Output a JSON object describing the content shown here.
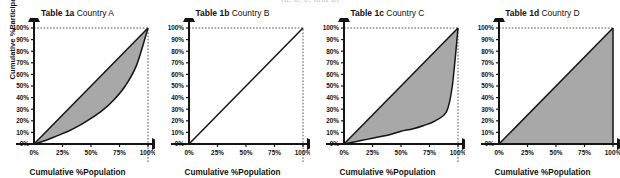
{
  "clipped_header": "(a, b, c, and d)",
  "axes": {
    "xlabel": "Cumulative %Population",
    "ylabel": "Cumulative %Participation",
    "x_ticks": [
      "0%",
      "25%",
      "50%",
      "75%",
      "100%"
    ],
    "x_tick_values": [
      0,
      25,
      50,
      75,
      100
    ],
    "y_ticks": [
      "0%",
      "10%",
      "20%",
      "30%",
      "40%",
      "50%",
      "60%",
      "70%",
      "80%",
      "90%",
      "100%"
    ],
    "y_tick_values": [
      0,
      10,
      20,
      30,
      40,
      50,
      60,
      70,
      80,
      90,
      100
    ],
    "xlim": [
      0,
      100
    ],
    "ylim": [
      0,
      100
    ]
  },
  "colors": {
    "fill": "#a8a8a8",
    "curve": "#141414",
    "axis": "#141414",
    "guide": "#555555",
    "background": "#ffffff"
  },
  "chart_data": [
    {
      "type": "area",
      "title": "Table 1a Country A",
      "title_bold": "Table 1a",
      "title_regular": "Country A",
      "xlabel": "Cumulative %Population",
      "ylabel": "Cumulative %Participation",
      "xlim": [
        0,
        100
      ],
      "ylim": [
        0,
        100
      ],
      "grid": false,
      "legend": "none",
      "annotations": [
        "dotted guide line at x=100%",
        "dotted guide line at y=100%"
      ],
      "series": [
        {
          "name": "Line of equality",
          "style": "solid",
          "x": [
            0,
            100
          ],
          "values": [
            0,
            100
          ]
        },
        {
          "name": "Lorenz curve",
          "style": "solid",
          "x": [
            0,
            10,
            20,
            30,
            40,
            50,
            60,
            70,
            80,
            90,
            100
          ],
          "values": [
            0,
            3,
            7,
            11,
            16,
            22,
            29,
            38,
            50,
            68,
            100
          ]
        }
      ],
      "shaded_between": [
        "Line of equality",
        "Lorenz curve"
      ]
    },
    {
      "type": "line",
      "title": "Table 1b Country B",
      "title_bold": "Table 1b",
      "title_regular": "Country B",
      "xlabel": "Cumulative %Population",
      "ylabel": "Cumulative %Participation",
      "xlim": [
        0,
        100
      ],
      "ylim": [
        0,
        100
      ],
      "grid": false,
      "legend": "none",
      "annotations": [
        "dotted guide line at x=100%",
        "dotted guide line at y=100%"
      ],
      "series": [
        {
          "name": "Line of equality",
          "style": "solid",
          "x": [
            0,
            100
          ],
          "values": [
            0,
            100
          ]
        }
      ],
      "shaded_between": []
    },
    {
      "type": "area",
      "title": "Table 1c Country C",
      "title_bold": "Table 1c",
      "title_regular": "Country C",
      "xlabel": "Cumulative %Population",
      "ylabel": "Cumulative %Participation",
      "xlim": [
        0,
        100
      ],
      "ylim": [
        0,
        100
      ],
      "grid": false,
      "legend": "none",
      "annotations": [
        "dotted guide line at x=100%",
        "dotted guide line at y=100%"
      ],
      "series": [
        {
          "name": "Line of equality",
          "style": "solid",
          "x": [
            0,
            100
          ],
          "values": [
            0,
            100
          ]
        },
        {
          "name": "Lorenz curve",
          "style": "solid",
          "x": [
            0,
            10,
            20,
            30,
            40,
            50,
            60,
            70,
            80,
            90,
            95,
            100
          ],
          "values": [
            0,
            2,
            4,
            6,
            8,
            11,
            13,
            16,
            20,
            28,
            50,
            100
          ]
        }
      ],
      "shaded_between": [
        "Line of equality",
        "Lorenz curve"
      ]
    },
    {
      "type": "area",
      "title": "Table 1d Country D",
      "title_bold": "Table 1d",
      "title_regular": "Country D",
      "xlabel": "Cumulative %Population",
      "ylabel": "Cumulative %Participation",
      "xlim": [
        0,
        100
      ],
      "ylim": [
        0,
        100
      ],
      "grid": false,
      "legend": "none",
      "annotations": [
        "dotted guide line at y=100%"
      ],
      "series": [
        {
          "name": "Line of equality",
          "style": "solid",
          "x": [
            0,
            100
          ],
          "values": [
            0,
            100
          ]
        },
        {
          "name": "Lorenz curve",
          "style": "solid",
          "x": [
            0,
            100,
            100
          ],
          "values": [
            0,
            0,
            100
          ]
        }
      ],
      "shaded_between": [
        "Line of equality",
        "Lorenz curve"
      ]
    }
  ]
}
